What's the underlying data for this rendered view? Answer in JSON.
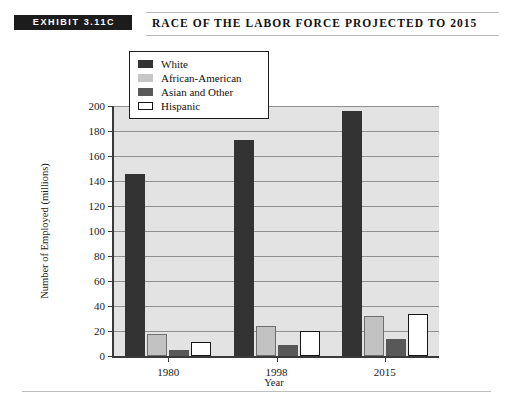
{
  "header": {
    "exhibit_tag": "EXHIBIT 3.11C",
    "title": "Race of the Labor Force Projected to 2015"
  },
  "legend": {
    "position": "top-left-inside",
    "items": [
      {
        "label": "White",
        "swatch": "sw-white",
        "color": "#333333"
      },
      {
        "label": "African-American",
        "swatch": "sw-african",
        "color": "#c6c6c6"
      },
      {
        "label": "Asian and Other",
        "swatch": "sw-asian",
        "color": "#585858"
      },
      {
        "label": "Hispanic",
        "swatch": "sw-hispanic",
        "color": "#ffffff"
      }
    ]
  },
  "chart_data": {
    "type": "bar",
    "title": "Race of the Labor Force Projected to 2015",
    "xlabel": "Year",
    "ylabel": "Number of Employed (millions)",
    "categories": [
      "1980",
      "1998",
      "2015"
    ],
    "ylim": [
      0,
      200
    ],
    "yticks": [
      0,
      20,
      40,
      60,
      80,
      100,
      120,
      140,
      160,
      180,
      200
    ],
    "grid": true,
    "legend_position": "upper left",
    "series": [
      {
        "name": "White",
        "values": [
          146,
          173,
          196
        ],
        "color": "#333333"
      },
      {
        "name": "African-American",
        "values": [
          18,
          24,
          32
        ],
        "color": "#c6c6c6"
      },
      {
        "name": "Asian and Other",
        "values": [
          5,
          9,
          14
        ],
        "color": "#585858"
      },
      {
        "name": "Hispanic",
        "values": [
          11,
          20,
          34
        ],
        "color": "#ffffff"
      }
    ]
  }
}
